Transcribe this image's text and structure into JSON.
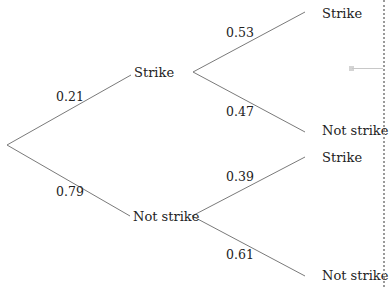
{
  "tree": {
    "root": {
      "x": 7,
      "y": 145
    },
    "level1": [
      {
        "label": "Strike",
        "probability": "0.21",
        "branch_end": {
          "x": 131,
          "y": 75
        },
        "vertex": {
          "x": 193,
          "y": 72
        },
        "children": [
          {
            "label": "Strike",
            "probability": "0.53",
            "branch_end": {
              "x": 305,
              "y": 12
            }
          },
          {
            "label": "Not strike",
            "probability": "0.47",
            "branch_end": {
              "x": 305,
              "y": 132
            }
          }
        ]
      },
      {
        "label": "Not strike",
        "probability": "0.79",
        "branch_end": {
          "x": 130,
          "y": 216
        },
        "vertex": {
          "x": 192,
          "y": 216
        },
        "children": [
          {
            "label": "Strike",
            "probability": "0.39",
            "branch_end": {
              "x": 305,
              "y": 157
            }
          },
          {
            "label": "Not strike",
            "probability": "0.61",
            "branch_end": {
              "x": 305,
              "y": 276
            }
          }
        ]
      }
    ]
  },
  "colors": {
    "line": "#7a7a7a",
    "text": "#222222",
    "dotted_border": "#9a9a9a"
  }
}
